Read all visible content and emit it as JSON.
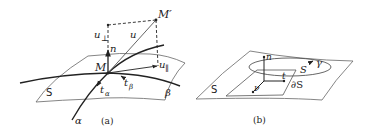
{
  "figure": {
    "panel_a": {
      "caption": "(a)",
      "surface_label": "S",
      "point": "M",
      "point_prime": "M′",
      "normal": "n",
      "vector": "u",
      "u_perp": "u",
      "u_perp_sub": "⊥",
      "u_par": "u",
      "u_par_sub": "∥",
      "t_alpha": "t",
      "t_alpha_sub": "α",
      "t_beta": "t",
      "t_beta_sub": "β",
      "curve_alpha": "α",
      "curve_beta": "β"
    },
    "panel_b": {
      "caption": "(b)",
      "surface_label": "S",
      "normal": "n",
      "tangent": "t",
      "conormal": "ν",
      "region": "S",
      "boundary": "∂S",
      "curve": "γ"
    },
    "colors": {
      "stroke": "#222222",
      "surface": "#555555",
      "background": "#ffffff"
    }
  }
}
